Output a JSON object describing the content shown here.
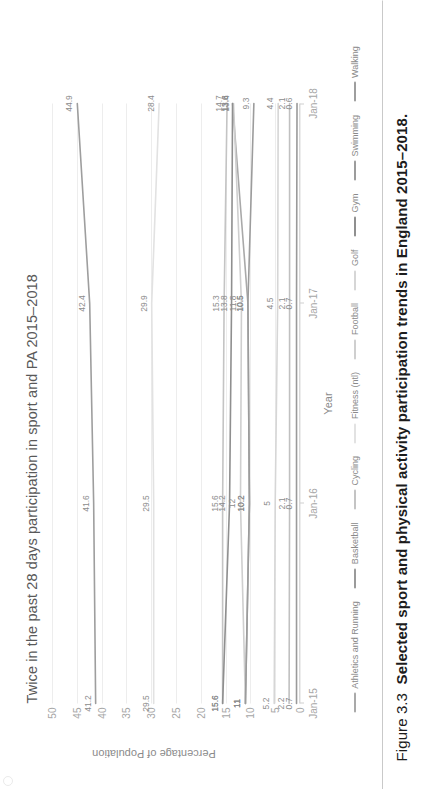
{
  "caption": {
    "figure_number": "Figure 3.3",
    "title": "Selected sport and physical activity participation trends in England 2015–2018."
  },
  "chart_data": {
    "type": "line",
    "title": "Twice in the past 28 days participation in sport and PA 2015–2018",
    "xlabel": "Year",
    "ylabel": "Percentage of Population",
    "categories": [
      "Jan-15",
      "Jan-16",
      "Jan-17",
      "Jan-18"
    ],
    "ylim": [
      0,
      50
    ],
    "yticks": [
      0,
      5,
      10,
      15,
      20,
      25,
      30,
      35,
      40,
      45,
      50
    ],
    "grid": true,
    "legend_position": "bottom",
    "series": [
      {
        "name": "Athletics and Running",
        "color": "#a9a9a9",
        "values": [
          11,
          10.2,
          10.5,
          13.6
        ],
        "labels": [
          "11",
          "10.2",
          "10.5",
          "13.6"
        ]
      },
      {
        "name": "Basketball",
        "color": "#9a9a9a",
        "values": [
          0.7,
          0.7,
          0.7,
          0.6
        ],
        "labels": [
          "0.7",
          "0.7",
          "0.7",
          "0.6"
        ]
      },
      {
        "name": "Cycling",
        "color": "#c4c4c4",
        "values": [
          15.6,
          15.6,
          15.3,
          14.7
        ],
        "labels": [
          "15.6",
          "15.6",
          "15.3",
          "14.7"
        ]
      },
      {
        "name": "Fitness (ntl)",
        "color": "#e2e2e2",
        "values": [
          29.5,
          29.5,
          29.9,
          28.4
        ],
        "labels": [
          "29.5",
          "29.5",
          "29.9",
          "28.4"
        ]
      },
      {
        "name": "Football",
        "color": "#cfcfcf",
        "values": [
          11,
          12,
          11.8,
          13.4
        ],
        "labels": [
          "11",
          "12",
          "11.8",
          "13.4"
        ]
      },
      {
        "name": "Golf",
        "color": "#d6d6d6",
        "values": [
          5.2,
          5,
          4.5,
          4.4
        ],
        "labels": [
          "5.2",
          "5",
          "4.5",
          "4.4"
        ]
      },
      {
        "name": "Gym",
        "color": "#8f8f8f",
        "values": [
          15.6,
          14.2,
          13.8,
          13.6
        ],
        "labels": [
          "15.6",
          "14.2",
          "13.8",
          "13.6"
        ]
      },
      {
        "name": "Swimming",
        "color": "#9c9c9c",
        "values": [
          11,
          10.2,
          10.5,
          9.3
        ],
        "labels": [
          "11",
          "10.2",
          "10.5",
          "9.3"
        ]
      },
      {
        "name": "Walking",
        "color": "#9e9e9e",
        "values": [
          41.2,
          41.6,
          42.4,
          44.9
        ],
        "labels": [
          "41.2",
          "41.6",
          "42.4",
          "44.9"
        ]
      },
      {
        "name": "Basketball-low",
        "color": "#c0c0c0",
        "values": [
          2.2,
          2.1,
          2.1,
          2.1
        ],
        "labels": [
          "2.2",
          "2.1",
          "2.1",
          "2.1"
        ]
      }
    ],
    "legend": [
      "Athletics and Running",
      "Basketball",
      "Cycling",
      "Fitness (ntl)",
      "Football",
      "Golf",
      "Gym",
      "Swimming",
      "Walking"
    ]
  }
}
